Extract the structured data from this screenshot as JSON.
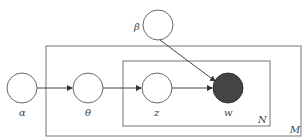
{
  "diagram": {
    "type": "plate-notation",
    "title": "",
    "nodes": [
      {
        "id": "alpha",
        "label": "α",
        "observed": false
      },
      {
        "id": "theta",
        "label": "θ",
        "observed": false
      },
      {
        "id": "z",
        "label": "z",
        "observed": false
      },
      {
        "id": "w",
        "label": "w",
        "observed": true
      },
      {
        "id": "beta",
        "label": "β",
        "observed": false
      }
    ],
    "edges": [
      {
        "from": "alpha",
        "to": "theta"
      },
      {
        "from": "theta",
        "to": "z"
      },
      {
        "from": "z",
        "to": "w"
      },
      {
        "from": "beta",
        "to": "w"
      }
    ],
    "plates": [
      {
        "id": "outer",
        "label": "M",
        "contains": [
          "theta",
          "z",
          "w"
        ]
      },
      {
        "id": "inner",
        "label": "N",
        "contains": [
          "z",
          "w"
        ]
      }
    ],
    "colors": {
      "observed_fill": "#444444",
      "stroke": "#555555"
    }
  }
}
